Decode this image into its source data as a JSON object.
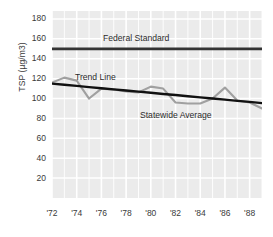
{
  "chart_data": {
    "type": "line",
    "title": "",
    "xlabel": "",
    "ylabel": "TSP (µg/m3)",
    "xlim": [
      1972,
      1989
    ],
    "ylim": [
      0,
      188
    ],
    "grid": true,
    "legend_position": "inline-annotations",
    "x": [
      1972,
      1973,
      1974,
      1975,
      1976,
      1977,
      1978,
      1979,
      1980,
      1981,
      1982,
      1983,
      1984,
      1985,
      1986,
      1987,
      1988,
      1989
    ],
    "series": [
      {
        "name": "Statewide Average",
        "color": "#a0a0a0",
        "values": [
          116,
          121,
          118,
          100,
          110,
          109,
          107,
          106,
          112,
          110,
          96,
          95,
          95,
          100,
          111,
          98,
          96,
          90
        ]
      },
      {
        "name": "Trend Line",
        "color": "#111111",
        "values": [
          115,
          113.8,
          112.7,
          111.5,
          110.4,
          109.2,
          108.1,
          106.9,
          105.8,
          104.6,
          103.5,
          102.3,
          101.2,
          100,
          98.9,
          97.7,
          96.6,
          95.4
        ]
      },
      {
        "name": "Federal Standard",
        "color": "#333333",
        "values": [
          150,
          150,
          150,
          150,
          150,
          150,
          150,
          150,
          150,
          150,
          150,
          150,
          150,
          150,
          150,
          150,
          150,
          150
        ]
      }
    ],
    "y_ticks": [
      20,
      40,
      60,
      80,
      100,
      120,
      140,
      160,
      180
    ],
    "x_ticks": [
      1972,
      1974,
      1976,
      1978,
      1980,
      1982,
      1984,
      1986,
      1988
    ],
    "x_tick_labels": [
      "'72",
      "'74",
      "'76",
      "'78",
      "'80",
      "'82",
      "'84",
      "'86",
      "'88"
    ],
    "annotations": [
      {
        "text": "Federal Standard",
        "x": 1979,
        "y": 155
      },
      {
        "text": "Trend Line",
        "x": 1974.5,
        "y": 124
      },
      {
        "text": "Statewide Average",
        "x": 1982.5,
        "y": 86
      }
    ]
  },
  "axes": {
    "y_title": "TSP (µg/m3)",
    "y_tick_labels": [
      "180",
      "160",
      "140",
      "120",
      "100",
      "80",
      "60",
      "40",
      "20"
    ],
    "x_tick_labels": [
      "'72",
      "'74",
      "'76",
      "'78",
      "'80",
      "'82",
      "'84",
      "'86",
      "'88"
    ]
  },
  "labels": {
    "federal_standard": "Federal Standard",
    "trend_line": "Trend Line",
    "statewide_average": "Statewide Average"
  },
  "colors": {
    "panel_background": "#ebebeb",
    "gridline": "#ffffff",
    "statewide_line": "#a0a0a0",
    "trend_line": "#111111",
    "federal_standard_line": "#333333",
    "text": "#3a3a3a"
  }
}
